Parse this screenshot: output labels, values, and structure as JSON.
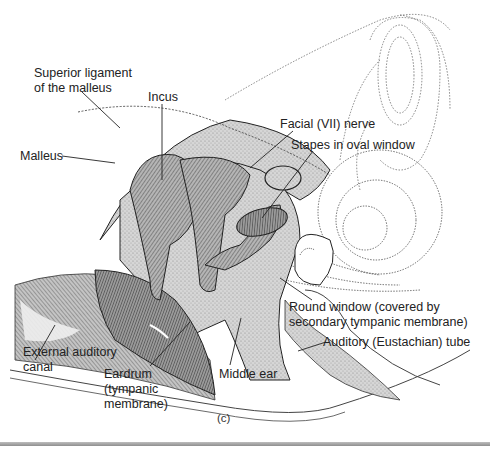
{
  "figure": {
    "caption": "(c)",
    "labels": [
      {
        "id": "superior-ligament",
        "lines": [
          "Superior ligament",
          "of the malleus"
        ]
      },
      {
        "id": "incus",
        "lines": [
          "Incus"
        ]
      },
      {
        "id": "malleus",
        "lines": [
          "Malleus"
        ]
      },
      {
        "id": "facial-nerve",
        "lines": [
          "Facial (VII) nerve"
        ]
      },
      {
        "id": "stapes",
        "lines": [
          "Stapes in oval window"
        ]
      },
      {
        "id": "round-window",
        "lines": [
          "Round window (covered by",
          "secondary tympanic membrane)"
        ]
      },
      {
        "id": "eustachian-tube",
        "lines": [
          "Auditory (Eustachian) tube"
        ]
      },
      {
        "id": "external-canal",
        "lines": [
          "External auditory",
          "canal"
        ]
      },
      {
        "id": "eardrum",
        "lines": [
          "Eardrum",
          "(tympanic",
          "membrane)"
        ]
      },
      {
        "id": "middle-ear",
        "lines": [
          "Middle ear"
        ]
      }
    ]
  },
  "colors": {
    "ink": "#222222",
    "bone_fill": "#cfcfcf",
    "ossicle_fill": "#8a8a8a",
    "membrane_fill": "#9a9a9a",
    "dotted": "#555555"
  }
}
